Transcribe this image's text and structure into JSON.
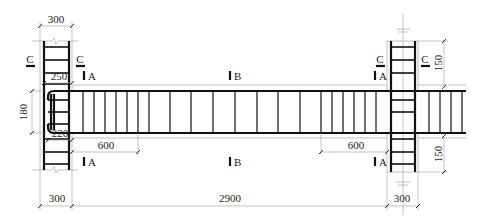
{
  "drawing": {
    "title": "Beam-column joint reinforcement elevation",
    "dimensions": {
      "left_column_width_top": "300",
      "left_column_width_bottom": "300",
      "right_column_width_bottom": "300",
      "beam_clear_span": "2900",
      "beam_depth": "180",
      "top_anchorage": "250",
      "bottom_anchorage": "220",
      "left_dense_zone": "600",
      "right_dense_zone": "600",
      "right_column_upper_extent": "150",
      "right_column_lower_extent": "150"
    },
    "section_marks": {
      "left_column_left": "C",
      "left_column_right": "C",
      "right_column_left": "C",
      "right_column_right": "C",
      "beam_left_top": "A",
      "beam_left_bottom": "A",
      "beam_mid_top": "B",
      "beam_mid_bottom": "B",
      "beam_right_top": "A",
      "beam_right_bottom": "A"
    }
  }
}
